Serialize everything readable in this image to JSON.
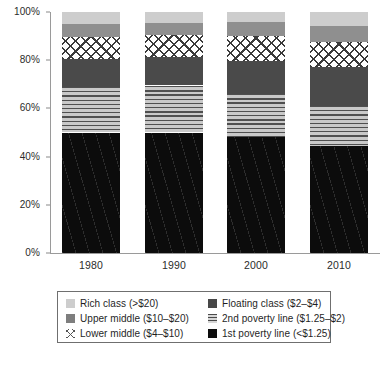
{
  "chart_data": {
    "type": "bar",
    "subtype": "100% stacked bar",
    "title": "",
    "xlabel": "",
    "ylabel": "",
    "categories": [
      "1980",
      "1990",
      "2000",
      "2010"
    ],
    "ylim": [
      0,
      100
    ],
    "ytick_labels": [
      "0%",
      "20%",
      "40%",
      "60%",
      "80%",
      "100%"
    ],
    "ytick_values": [
      0,
      20,
      40,
      60,
      80,
      100
    ],
    "grid": false,
    "legend_position": "bottom",
    "stack_order_bottom_to_top": [
      "1st poverty line (<$1.25)",
      "2nd poverty line ($1.25-$2)",
      "Floating class ($2-$4)",
      "Lower middle ($4-$10)",
      "Upper middle ($10-$20)",
      "Rich class (>$20)"
    ],
    "series": [
      {
        "name": "1st poverty line (<$1.25)",
        "key": "first",
        "values": [
          50.0,
          50.0,
          48.0,
          44.5
        ]
      },
      {
        "name": "2nd poverty line ($1.25-$2)",
        "key": "second",
        "values": [
          19.0,
          19.5,
          18.0,
          16.5
        ]
      },
      {
        "name": "Floating class ($2-$4)",
        "key": "floating",
        "values": [
          11.5,
          12.0,
          13.5,
          16.0
        ]
      },
      {
        "name": "Lower middle ($4-$10)",
        "key": "lower",
        "values": [
          9.0,
          9.0,
          10.5,
          10.5
        ]
      },
      {
        "name": "Upper middle ($10-$20)",
        "key": "upper",
        "values": [
          5.5,
          5.0,
          6.0,
          6.5
        ]
      },
      {
        "name": "Rich class (>$20)",
        "key": "rich",
        "values": [
          5.0,
          4.5,
          4.0,
          6.0
        ]
      }
    ],
    "colors": {
      "rich": "#cdcdcd",
      "upper": "#8f8f8f",
      "lower": "#ffffff",
      "floating": "#4a4a4a",
      "second": "#c9c9c9",
      "first": "#0c0c0c",
      "axis": "#9a9a9a",
      "text": "#1f1f1f"
    }
  },
  "axes": {
    "y_ticks": [
      {
        "label": "100%",
        "value": 100
      },
      {
        "label": "80%",
        "value": 80
      },
      {
        "label": "60%",
        "value": 60
      },
      {
        "label": "40%",
        "value": 40
      },
      {
        "label": "20%",
        "value": 20
      },
      {
        "label": "0%",
        "value": 0
      }
    ],
    "x_ticks": [
      {
        "label": "1980"
      },
      {
        "label": "1990"
      },
      {
        "label": "2000"
      },
      {
        "label": "2010"
      }
    ]
  },
  "legend": {
    "columns": [
      {
        "items": [
          {
            "label": "Rich class (>$20)",
            "swatch": "rich"
          },
          {
            "label": "Upper middle ($10–$20)",
            "swatch": "upper"
          },
          {
            "label": "Lower middle ($4–$10)",
            "swatch": "lower"
          }
        ]
      },
      {
        "items": [
          {
            "label": "Floating class ($2–$4)",
            "swatch": "floating"
          },
          {
            "label": "2nd poverty line ($1.25–$2)",
            "swatch": "second"
          },
          {
            "label": "1st poverty line (<$1.25)",
            "swatch": "first"
          }
        ]
      }
    ]
  }
}
